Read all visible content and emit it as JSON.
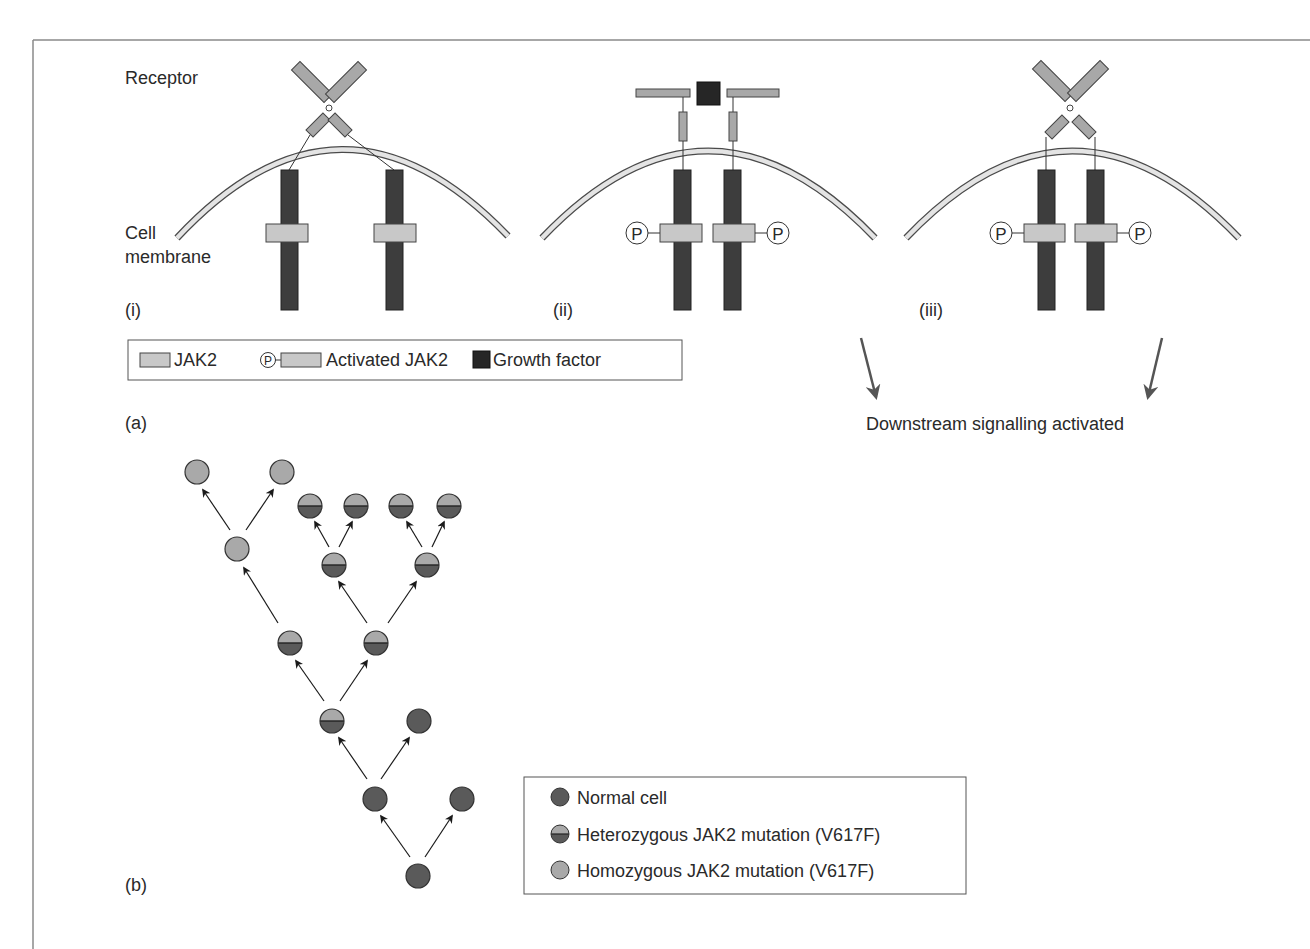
{
  "colors": {
    "frame": "#8a8a8a",
    "membrane_fill": "#e4e4e4",
    "membrane_stroke": "#4a4a4a",
    "receptor_fill": "#a8a8a8",
    "receptor_dark": "#3d3d3d",
    "jak2_fill": "#c8c8c8",
    "growth_factor": "#262626",
    "normal_cell": "#5a5a5a",
    "homozygous_cell": "#a9a9a9",
    "arrow": "#555555"
  },
  "panel_a": {
    "label": "(a)",
    "labels": {
      "receptor": "Receptor",
      "cell": "Cell",
      "membrane": "membrane"
    },
    "subpanels": [
      {
        "id": "i",
        "label": "(i)",
        "state": "inactive receptor, unphosphorylated JAK2"
      },
      {
        "id": "ii",
        "label": "(ii)",
        "state": "growth factor bound, JAK2 activated"
      },
      {
        "id": "iii",
        "label": "(iii)",
        "state": "V617F: JAK2 activated without growth factor"
      }
    ],
    "phospho_symbol": "P",
    "legend": {
      "items": [
        {
          "label": "JAK2",
          "symbol": "jak2-box"
        },
        {
          "label": "Activated JAK2",
          "symbol": "phospho-jak2"
        },
        {
          "label": "Growth factor",
          "symbol": "dark-square"
        }
      ]
    },
    "downstream_text": "Downstream signalling activated"
  },
  "panel_b": {
    "label": "(b)",
    "legend": {
      "items": [
        {
          "label": "Normal cell",
          "type": "normal"
        },
        {
          "label": "Heterozygous JAK2 mutation (V617F)",
          "type": "hetero"
        },
        {
          "label": "Homozygous JAK2 mutation (V617F)",
          "type": "homo"
        }
      ]
    },
    "tree_nodes": [
      {
        "x": 418,
        "y": 876,
        "type": "normal"
      },
      {
        "x": 375,
        "y": 799,
        "type": "normal"
      },
      {
        "x": 462,
        "y": 799,
        "type": "normal"
      },
      {
        "x": 332,
        "y": 721,
        "type": "hetero"
      },
      {
        "x": 419,
        "y": 721,
        "type": "normal"
      },
      {
        "x": 290,
        "y": 643,
        "type": "hetero"
      },
      {
        "x": 376,
        "y": 643,
        "type": "hetero"
      },
      {
        "x": 237,
        "y": 549,
        "type": "homo"
      },
      {
        "x": 334,
        "y": 565,
        "type": "hetero"
      },
      {
        "x": 427,
        "y": 565,
        "type": "hetero"
      },
      {
        "x": 197,
        "y": 472,
        "type": "homo"
      },
      {
        "x": 282,
        "y": 472,
        "type": "homo"
      },
      {
        "x": 310,
        "y": 506,
        "type": "hetero"
      },
      {
        "x": 356,
        "y": 506,
        "type": "hetero"
      },
      {
        "x": 401,
        "y": 506,
        "type": "hetero"
      },
      {
        "x": 449,
        "y": 506,
        "type": "hetero"
      }
    ]
  }
}
